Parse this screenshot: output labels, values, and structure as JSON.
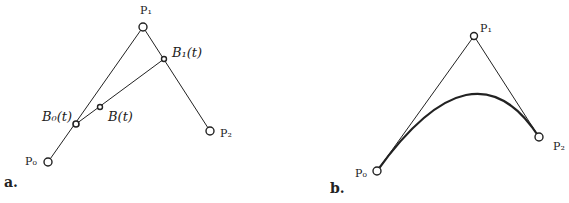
{
  "panel_a": {
    "caption": "a.",
    "labels": {
      "p0": "P₀",
      "p1": "P₁",
      "p2": "P₂",
      "b0": "B₀(t)",
      "b1": "B₁(t)",
      "b": "B(t)"
    }
  },
  "panel_b": {
    "caption": "b.",
    "labels": {
      "p0": "P₀",
      "p1": "P₁",
      "p2": "P₂"
    }
  },
  "colors": {
    "stroke": "#222222",
    "background": "#ffffff"
  }
}
